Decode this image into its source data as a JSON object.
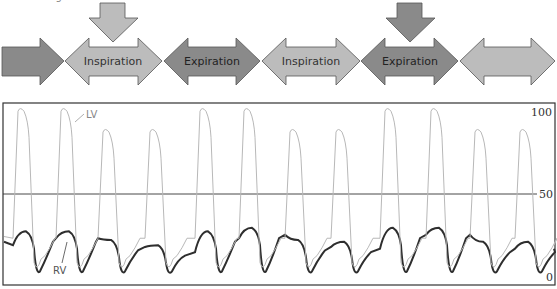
{
  "caption_fragment": "LV unchanged.",
  "colors": {
    "dark_arrow": "#8a8a8a",
    "light_arrow": "#bcbcbc",
    "arrow_stroke": "#555555",
    "lv_trace": "#b8b8b8",
    "rv_trace": "#2e2e2e",
    "frame": "#333333"
  },
  "phase_arrows": [
    {
      "label": "",
      "shade": "dark",
      "shape": "right"
    },
    {
      "label": "Inspiration",
      "shade": "light",
      "shape": "double"
    },
    {
      "label": "Expiration",
      "shade": "dark",
      "shape": "double"
    },
    {
      "label": "Inspiration",
      "shade": "light",
      "shape": "double"
    },
    {
      "label": "Expiration",
      "shade": "dark",
      "shape": "double"
    },
    {
      "label": "",
      "shade": "light",
      "shape": "double"
    }
  ],
  "down_arrows": [
    {
      "over": "Inspiration",
      "shade": "light"
    },
    {
      "over": "Expiration",
      "shade": "dark"
    }
  ],
  "chart_data": {
    "type": "line",
    "title": "",
    "xlabel": "",
    "ylabel": "Pressure (mmHg)",
    "ylim": [
      0,
      100
    ],
    "y_ticks": [
      "100",
      "50",
      "0"
    ],
    "reference_line": 50,
    "grid": false,
    "annotations": [
      "LV",
      "RV"
    ],
    "series": [
      {
        "name": "LV",
        "peaks": [
          100,
          100,
          88,
          88,
          100,
          100,
          88,
          88,
          100,
          100,
          88,
          88
        ],
        "diastolic_min": 8
      },
      {
        "name": "RV",
        "peaks": [
          28,
          28,
          23,
          20,
          28,
          30,
          23,
          22,
          30,
          30,
          22,
          22
        ],
        "diastolic_min": 3
      }
    ],
    "beat_x_positions": [
      20,
      63,
      105,
      152,
      202,
      246,
      292,
      338,
      387,
      433,
      477,
      522
    ]
  }
}
